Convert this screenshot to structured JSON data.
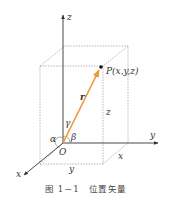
{
  "diagram": {
    "axes": {
      "x": "x",
      "y": "y",
      "z": "z"
    },
    "origin_label": "O",
    "point_label": "P(x,y,z)",
    "vector_label": "r",
    "angles": {
      "alpha": "α",
      "beta": "β",
      "gamma": "γ"
    },
    "edge_labels": {
      "z": "z",
      "x": "x",
      "y": "y"
    },
    "colors": {
      "vector": "#f0953a",
      "axis": "#333333",
      "dashed": "#8a8a8a"
    }
  },
  "caption": {
    "number": "图 1－1",
    "title": "位置矢量"
  }
}
